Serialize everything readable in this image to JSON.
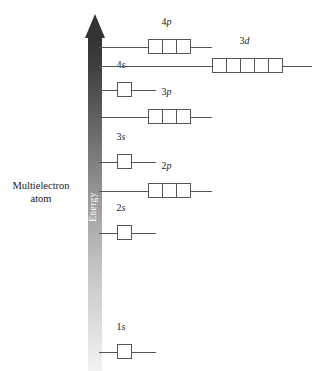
{
  "caption": {
    "line1": "Multielectron",
    "line2": "atom"
  },
  "axis": {
    "label": "Energy",
    "direction": "up",
    "arrow_color": "#333333",
    "gradient_from": "#f2f2f2",
    "gradient_to": "#333333"
  },
  "chart_data": {
    "type": "diagram",
    "ylabel": "Energy",
    "grid": false,
    "legend": false,
    "levels": [
      {
        "name": "1s",
        "n": 1,
        "subshell": "s",
        "boxes": 1,
        "energy_rank": 1,
        "y": 352,
        "box_left": 117,
        "line_left": 99,
        "line_right": 156
      },
      {
        "name": "2s",
        "n": 2,
        "subshell": "s",
        "boxes": 1,
        "energy_rank": 2,
        "y": 233,
        "box_left": 117,
        "line_left": 99,
        "line_right": 156
      },
      {
        "name": "2p",
        "n": 2,
        "subshell": "p",
        "boxes": 3,
        "energy_rank": 3,
        "y": 191,
        "box_left": 148,
        "line_left": 99,
        "line_right": 212
      },
      {
        "name": "3s",
        "n": 3,
        "subshell": "s",
        "boxes": 1,
        "energy_rank": 4,
        "y": 162,
        "box_left": 117,
        "line_left": 99,
        "line_right": 156
      },
      {
        "name": "3p",
        "n": 3,
        "subshell": "p",
        "boxes": 3,
        "energy_rank": 5,
        "y": 117,
        "box_left": 148,
        "line_left": 99,
        "line_right": 212
      },
      {
        "name": "4s",
        "n": 4,
        "subshell": "s",
        "boxes": 1,
        "energy_rank": 6,
        "y": 90,
        "box_left": 117,
        "line_left": 99,
        "line_right": 156
      },
      {
        "name": "3d",
        "n": 3,
        "subshell": "d",
        "boxes": 5,
        "energy_rank": 7,
        "y": 66,
        "box_left": 212,
        "line_left": 99,
        "line_right": 312
      },
      {
        "name": "4p",
        "n": 4,
        "subshell": "p",
        "boxes": 3,
        "energy_rank": 8,
        "y": 47,
        "box_left": 148,
        "line_left": 99,
        "line_right": 212
      }
    ],
    "labels": {
      "1s": {
        "n": "1",
        "letter": "s"
      },
      "2s": {
        "n": "2",
        "letter": "s"
      },
      "2p": {
        "n": "2",
        "letter": "p"
      },
      "3s": {
        "n": "3",
        "letter": "s"
      },
      "3p": {
        "n": "3",
        "letter": "p"
      },
      "4s": {
        "n": "4",
        "letter": "s"
      },
      "3d": {
        "n": "3",
        "letter": "d"
      },
      "4p": {
        "n": "4",
        "letter": "p"
      }
    }
  }
}
